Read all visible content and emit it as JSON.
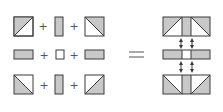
{
  "diagram": {
    "colors": {
      "stroke": "#3a3a3a",
      "fill_shaded": "#c8c8c8",
      "fill_white": "#ffffff",
      "operator": "#555555"
    },
    "operators": {
      "plus": "+",
      "equals": "="
    },
    "rows": [
      {
        "name": "top",
        "pieces": [
          {
            "shape": "square",
            "diagonal": "bl-tr",
            "shaded": "upper-left triangle"
          },
          {
            "shape": "tall-rect",
            "shaded": "full"
          },
          {
            "shape": "square",
            "diagonal": "tl-br",
            "shaded": "upper-right triangle"
          }
        ]
      },
      {
        "name": "middle",
        "pieces": [
          {
            "shape": "wide-rect",
            "shaded": "full"
          },
          {
            "shape": "small-square",
            "shaded": "none"
          },
          {
            "shape": "wide-rect",
            "shaded": "full"
          }
        ]
      },
      {
        "name": "bottom",
        "pieces": [
          {
            "shape": "square",
            "diagonal": "tl-br",
            "shaded": "lower-left triangle"
          },
          {
            "shape": "tall-rect",
            "shaded": "full"
          },
          {
            "shape": "square",
            "diagonal": "bl-tr",
            "shaded": "lower-right triangle"
          }
        ]
      }
    ],
    "result": {
      "parts": [
        "top composite",
        "middle composite",
        "bottom composite"
      ],
      "connectors": "double-headed vertical arrows between composites"
    }
  }
}
